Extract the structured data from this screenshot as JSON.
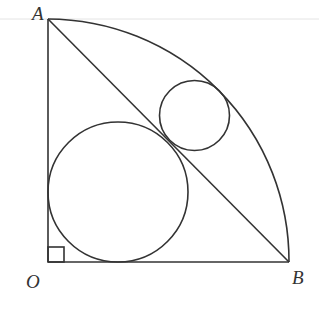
{
  "diagram": {
    "type": "geometry",
    "labels": {
      "A": "A",
      "O": "O",
      "B": "B"
    },
    "points": {
      "O": [
        48,
        262
      ],
      "A": [
        48,
        19
      ],
      "B": [
        289,
        262
      ]
    },
    "sector_radius": 242,
    "large_circle": {
      "cx": 118,
      "cy": 192,
      "r": 70
    },
    "small_circle": {
      "cx": 194.5,
      "cy": 115.5,
      "r": 35
    },
    "right_angle_marker": {
      "x": 48,
      "y": 247,
      "size": 16
    },
    "colors": {
      "stroke": "#333333",
      "background": "#ffffff"
    }
  }
}
